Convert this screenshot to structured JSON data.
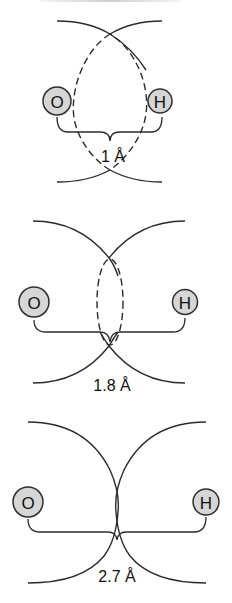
{
  "figure": {
    "colors": {
      "atom_fill": "#d6d6d6",
      "stroke": "#2b2b2b",
      "background": "#ffffff"
    },
    "panels": [
      {
        "id": "panel-1",
        "atom_left": "O",
        "atom_right": "H",
        "distance_label": "1 Å",
        "overlap_style": "dashed large overlap"
      },
      {
        "id": "panel-2",
        "atom_left": "O",
        "atom_right": "H",
        "distance_label": "1.8 Å",
        "overlap_style": "dashed small overlap"
      },
      {
        "id": "panel-3",
        "atom_left": "O",
        "atom_right": "H",
        "distance_label": "2.7 Å",
        "overlap_style": "touching, no overlap"
      }
    ]
  }
}
